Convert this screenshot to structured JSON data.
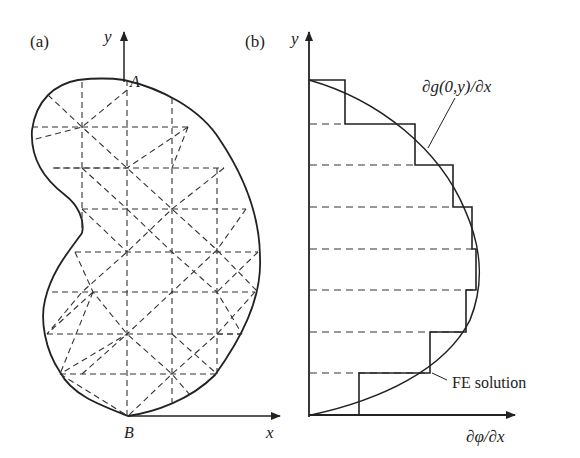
{
  "panels": {
    "a": {
      "label": "(a)",
      "axis_y": "y",
      "axis_x": "x",
      "point_top": "A",
      "point_bottom": "B",
      "description": "Kidney-shaped domain with dashed triangular finite element mesh"
    },
    "b": {
      "label": "(b)",
      "axis_y": "y",
      "axis_x": "∂φ/∂x",
      "curve_label": "∂g(0,y)/∂x",
      "step_label": "FE solution",
      "description": "Exact boundary derivative curve vs piecewise-constant FE solution along y"
    }
  },
  "colors": {
    "ink": "#222222",
    "background": "#ffffff"
  }
}
